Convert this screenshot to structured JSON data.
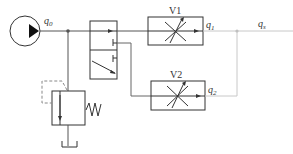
{
  "diagram": {
    "type": "hydraulic-circuit",
    "labels": {
      "pump_flow": "q",
      "pump_flow_sub": "0",
      "valve1": "V1",
      "valve2": "V2",
      "flow1": "q",
      "flow1_sub": "1",
      "flow2": "q",
      "flow2_sub": "2",
      "flow_sum": "q",
      "flow_sum_sub": "s"
    },
    "components": [
      {
        "id": "pump",
        "kind": "hydraulic-pump"
      },
      {
        "id": "directional-valve",
        "kind": "2-position directional valve"
      },
      {
        "id": "relief-valve",
        "kind": "pressure relief valve with spring"
      },
      {
        "id": "tank",
        "kind": "reservoir"
      },
      {
        "id": "V1",
        "kind": "adjustable throttle valve"
      },
      {
        "id": "V2",
        "kind": "adjustable throttle valve"
      }
    ],
    "colors": {
      "line": "#333333",
      "light_line": "#c8c8c8",
      "dashed": "#888888"
    }
  }
}
